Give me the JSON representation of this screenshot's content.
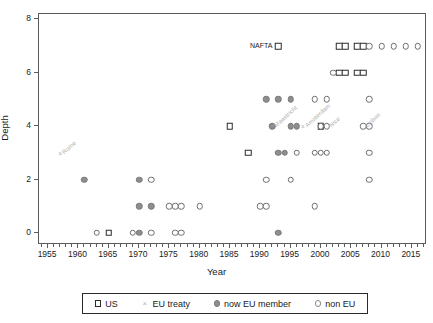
{
  "chart_data": {
    "type": "scatter",
    "title": "",
    "xlabel": "Year",
    "ylabel": "Depth",
    "xlim": [
      1953.5,
      2017.5
    ],
    "ylim": [
      -0.45,
      8.2
    ],
    "xticks": [
      1955,
      1960,
      1965,
      1970,
      1975,
      1980,
      1985,
      1990,
      1995,
      2000,
      2005,
      2010,
      2015
    ],
    "yticks": [
      0,
      2,
      4,
      6,
      8
    ],
    "grid": false,
    "legend_position": "below-axes",
    "legend": [
      {
        "key": "us",
        "label": "US",
        "marker": "open-square",
        "color": "#2b2b2b"
      },
      {
        "key": "treaty",
        "label": "EU treaty",
        "marker": "cross",
        "color": "#b4b4b4"
      },
      {
        "key": "eumem",
        "label": "now EU member",
        "marker": "filled-circle",
        "color": "#8e8e8e"
      },
      {
        "key": "nonue",
        "label": "non EU",
        "marker": "open-circle",
        "color": "#8a8a8a"
      }
    ],
    "series": [
      {
        "name": "US",
        "key": "us",
        "points": [
          [
            1965,
            0
          ],
          [
            1988,
            3
          ],
          [
            1985,
            4
          ],
          [
            2000,
            4
          ],
          [
            1993,
            7
          ],
          [
            2003,
            7
          ],
          [
            2004,
            7
          ],
          [
            2006,
            7
          ],
          [
            2007,
            7
          ],
          [
            2003,
            6
          ],
          [
            2004,
            6
          ],
          [
            2006,
            6
          ],
          [
            2007,
            6
          ]
        ]
      },
      {
        "name": "EU treaty",
        "key": "treaty",
        "points": [
          [
            1957,
            3
          ],
          [
            1992,
            4
          ],
          [
            1997,
            4
          ],
          [
            2001,
            4
          ],
          [
            2007,
            4
          ]
        ]
      },
      {
        "name": "now EU member",
        "key": "eumem",
        "points": [
          [
            1961,
            2
          ],
          [
            1970,
            2
          ],
          [
            1970,
            1
          ],
          [
            1972,
            1
          ],
          [
            1970,
            0
          ],
          [
            1993,
            0
          ],
          [
            1993,
            3
          ],
          [
            1994,
            3
          ],
          [
            1992,
            4
          ],
          [
            1995,
            4
          ],
          [
            1996,
            4
          ],
          [
            1991,
            5
          ],
          [
            1993,
            5
          ],
          [
            1995,
            5
          ]
        ]
      },
      {
        "name": "non EU",
        "key": "nonue",
        "points": [
          [
            1963,
            0
          ],
          [
            1969,
            0
          ],
          [
            1972,
            0
          ],
          [
            1976,
            0
          ],
          [
            1977,
            0
          ],
          [
            1975,
            1
          ],
          [
            1976,
            1
          ],
          [
            1977,
            1
          ],
          [
            1980,
            1
          ],
          [
            1990,
            1
          ],
          [
            1991,
            1
          ],
          [
            1999,
            1
          ],
          [
            1972,
            2
          ],
          [
            1991,
            2
          ],
          [
            1995,
            2
          ],
          [
            2008,
            2
          ],
          [
            1996,
            3
          ],
          [
            1999,
            3
          ],
          [
            2000,
            3
          ],
          [
            2001,
            3
          ],
          [
            2008,
            3
          ],
          [
            2000,
            4
          ],
          [
            2001,
            4
          ],
          [
            2007,
            4
          ],
          [
            2008,
            4
          ],
          [
            1999,
            5
          ],
          [
            2001,
            5
          ],
          [
            2008,
            5
          ],
          [
            2002,
            6
          ],
          [
            2008,
            7
          ],
          [
            2010,
            7
          ],
          [
            2012,
            7
          ],
          [
            2014,
            7
          ],
          [
            2016,
            7
          ]
        ]
      }
    ],
    "annotations": [
      {
        "text": "Rome",
        "x": 1957,
        "y": 3,
        "rotation": -42
      },
      {
        "text": "Maastricht",
        "x": 1992,
        "y": 4,
        "rotation": -42
      },
      {
        "text": "Amsterdam",
        "x": 1997,
        "y": 4,
        "rotation": -42
      },
      {
        "text": "Nice",
        "x": 2001,
        "y": 4,
        "rotation": -42
      },
      {
        "text": "Lisbon",
        "x": 2007,
        "y": 4,
        "rotation": -42
      },
      {
        "text": "NAFTA",
        "x": 1993,
        "y": 7,
        "rotation": 0,
        "align": "left-of-point"
      }
    ]
  }
}
